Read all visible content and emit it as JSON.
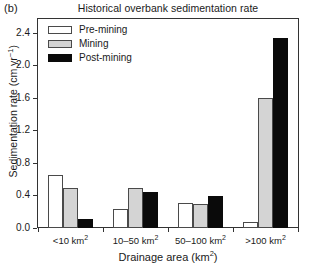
{
  "panel_label": "(b)",
  "chart_data": {
    "type": "bar",
    "title": "Historical overbank sedimentation rate",
    "xlabel": "Drainage area (km²)",
    "ylabel": "Sedimentation rate (cm yr⁻¹)",
    "xlabel_parts": {
      "text": "Drainage area (km",
      "sup": "2",
      "tail": ")"
    },
    "ylabel_parts": {
      "text": "Sedimentation rate (cm yr",
      "sup": "−1",
      "tail": ")"
    },
    "categories": [
      "<10 km²",
      "10–50 km²",
      "50–100 km²",
      ">100 km²"
    ],
    "category_parts": [
      {
        "text": "<10 km",
        "sup": "2"
      },
      {
        "text": "10–50 km",
        "sup": "2"
      },
      {
        "text": "50–100 km",
        "sup": "2"
      },
      {
        "text": ">100 km",
        "sup": "2"
      }
    ],
    "series": [
      {
        "name": "Pre-mining",
        "color": "#ffffff",
        "values": [
          0.66,
          0.23,
          0.31,
          0.07
        ]
      },
      {
        "name": "Mining",
        "color": "#d4d4d4",
        "values": [
          0.5,
          0.5,
          0.3,
          1.6
        ]
      },
      {
        "name": "Post-mining",
        "color": "#0a0a0a",
        "values": [
          0.11,
          0.44,
          0.4,
          2.35
        ]
      }
    ],
    "ylim": [
      0.0,
      2.58
    ],
    "yticks": [
      0.0,
      0.4,
      0.8,
      1.2,
      1.6,
      2.0,
      2.4
    ],
    "ytick_labels": [
      "0.0",
      "0.4",
      "0.8",
      "1.2",
      "1.6",
      "2.0",
      "2.4"
    ],
    "grid": false,
    "legend_position": "top-left",
    "axis_color": "#333333",
    "bar_edge_color": "#4a4a4a"
  },
  "legend": {
    "items": [
      {
        "label": "Pre-mining",
        "swatch": "pre"
      },
      {
        "label": "Mining",
        "swatch": "mining"
      },
      {
        "label": "Post-mining",
        "swatch": "post"
      }
    ]
  }
}
